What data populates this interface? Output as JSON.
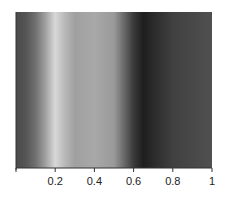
{
  "chart_data": {
    "type": "heatmap",
    "title": "",
    "xlabel": "",
    "ylabel": "",
    "xlim": [
      0,
      1
    ],
    "grid": false,
    "legend": null,
    "colormap": "grayscale",
    "x_ticks": [
      0,
      0.2,
      0.4,
      0.6,
      0.8,
      1
    ],
    "x_tick_labels": [
      "",
      "0.2",
      "0.4",
      "0.6",
      "0.8",
      "1"
    ],
    "intensity_profile": {
      "x": [
        0.0,
        0.05,
        0.1,
        0.15,
        0.2,
        0.25,
        0.3,
        0.4,
        0.5,
        0.55,
        0.6,
        0.65,
        0.7,
        0.8,
        0.9,
        1.0
      ],
      "gray": [
        74,
        85,
        112,
        160,
        216,
        184,
        160,
        168,
        154,
        106,
        58,
        30,
        42,
        64,
        72,
        80
      ]
    }
  }
}
